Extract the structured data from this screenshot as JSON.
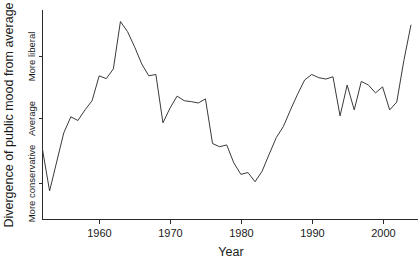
{
  "chart_data": {
    "type": "line",
    "title": "",
    "xlabel": "Year",
    "ylabel": "Divergence of public mood from average",
    "xlim": [
      1952,
      2005
    ],
    "ylim": [
      -2.2,
      2.35
    ],
    "grid": false,
    "legend": null,
    "x_ticks": [
      1960,
      1970,
      1980,
      1990,
      2000
    ],
    "x_tick_labels": [
      "1960",
      "1970",
      "1980",
      "1990",
      "2000"
    ],
    "y_ticks": [
      -1.4,
      0.0,
      1.35
    ],
    "y_tick_labels": [
      "More conservative",
      "Average",
      "More liberal"
    ],
    "series": [
      {
        "name": "Public mood",
        "x": [
          1952,
          1953,
          1954,
          1955,
          1956,
          1957,
          1958,
          1959,
          1960,
          1961,
          1962,
          1963,
          1964,
          1965,
          1966,
          1967,
          1968,
          1969,
          1970,
          1971,
          1972,
          1973,
          1974,
          1975,
          1976,
          1977,
          1978,
          1979,
          1980,
          1981,
          1982,
          1983,
          1984,
          1985,
          1986,
          1987,
          1988,
          1989,
          1990,
          1991,
          1992,
          1993,
          1994,
          1995,
          1996,
          1997,
          1998,
          1999,
          2000,
          2001,
          2002,
          2003,
          2004
        ],
        "y": [
          -0.68,
          -1.58,
          -0.95,
          -0.32,
          0.03,
          -0.05,
          0.18,
          0.38,
          0.92,
          0.86,
          1.07,
          2.1,
          1.88,
          1.55,
          1.18,
          0.92,
          0.95,
          -0.1,
          0.22,
          0.48,
          0.38,
          0.36,
          0.33,
          0.42,
          -0.55,
          -0.62,
          -0.58,
          -0.97,
          -1.22,
          -1.18,
          -1.38,
          -1.15,
          -0.78,
          -0.42,
          -0.18,
          0.18,
          0.52,
          0.83,
          0.95,
          0.88,
          0.85,
          0.9,
          0.05,
          0.72,
          0.18,
          0.8,
          0.72,
          0.55,
          0.68,
          0.18,
          0.35,
          1.25,
          2.02
        ]
      }
    ]
  },
  "axis": {
    "x_title": "Year",
    "y_title": "Divergence of public mood from average",
    "y_categories": {
      "top": "More liberal",
      "middle": "Average",
      "bottom": "More conservative"
    }
  },
  "colors": {
    "line": "#3a3a3a",
    "axis": "#2b2b2b",
    "text": "#1a1a1a",
    "background": "#ffffff"
  }
}
